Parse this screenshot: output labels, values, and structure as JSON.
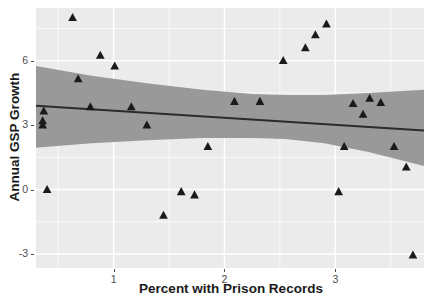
{
  "chart_data": {
    "type": "scatter",
    "title": "",
    "xlabel": "Percent with Prison Records",
    "ylabel": "Annual GSP Growth",
    "xlim": [
      0.3,
      3.8
    ],
    "ylim": [
      -3.65,
      8.45
    ],
    "xticks": [
      1,
      2,
      3
    ],
    "xticklabels": [
      "1",
      "2",
      "3"
    ],
    "yticks": [
      -3,
      0,
      3,
      6
    ],
    "yticklabels": [
      "-3",
      "0",
      "3",
      "6"
    ],
    "grid": true,
    "legend": "none",
    "panel_background": "#ebebeb",
    "grid_color": "#ffffff",
    "point_color": "#1a1a1a",
    "point_marker": "triangle",
    "line_color": "#2b2b2b",
    "band_color": "#999999",
    "points": [
      {
        "x": 0.37,
        "y": 3.65
      },
      {
        "x": 0.36,
        "y": 3.2
      },
      {
        "x": 0.36,
        "y": 3.0
      },
      {
        "x": 0.4,
        "y": 0.0
      },
      {
        "x": 0.63,
        "y": 8.0
      },
      {
        "x": 0.68,
        "y": 5.15
      },
      {
        "x": 0.79,
        "y": 3.85
      },
      {
        "x": 0.88,
        "y": 6.25
      },
      {
        "x": 1.01,
        "y": 5.75
      },
      {
        "x": 1.16,
        "y": 3.85
      },
      {
        "x": 1.3,
        "y": 3.0
      },
      {
        "x": 1.45,
        "y": -1.2
      },
      {
        "x": 1.61,
        "y": -0.1
      },
      {
        "x": 1.73,
        "y": -0.25
      },
      {
        "x": 1.85,
        "y": 2.0
      },
      {
        "x": 2.09,
        "y": 4.1
      },
      {
        "x": 2.32,
        "y": 4.1
      },
      {
        "x": 2.53,
        "y": 6.0
      },
      {
        "x": 2.73,
        "y": 6.6
      },
      {
        "x": 2.82,
        "y": 7.2
      },
      {
        "x": 2.92,
        "y": 7.7
      },
      {
        "x": 3.03,
        "y": -0.1
      },
      {
        "x": 3.08,
        "y": 2.0
      },
      {
        "x": 3.16,
        "y": 4.0
      },
      {
        "x": 3.25,
        "y": 3.5
      },
      {
        "x": 3.31,
        "y": 4.25
      },
      {
        "x": 3.41,
        "y": 4.05
      },
      {
        "x": 3.53,
        "y": 2.0
      },
      {
        "x": 3.64,
        "y": 1.05
      },
      {
        "x": 3.7,
        "y": -3.05
      }
    ],
    "fit_line": {
      "x_start": 0.3,
      "y_start": 3.9,
      "x_end": 3.8,
      "y_end": 2.75
    },
    "confidence_band": {
      "x": [
        0.3,
        0.8,
        1.3,
        1.8,
        2.25,
        2.55,
        2.9,
        3.3,
        3.8
      ],
      "upper": [
        5.75,
        5.3,
        4.95,
        4.65,
        4.45,
        4.4,
        4.4,
        4.5,
        4.65
      ],
      "lower": [
        1.95,
        2.15,
        2.3,
        2.4,
        2.4,
        2.35,
        2.15,
        1.75,
        1.1
      ]
    }
  },
  "axes": {
    "y_title": "Annual GSP Growth",
    "x_title": "Percent with Prison Records"
  }
}
